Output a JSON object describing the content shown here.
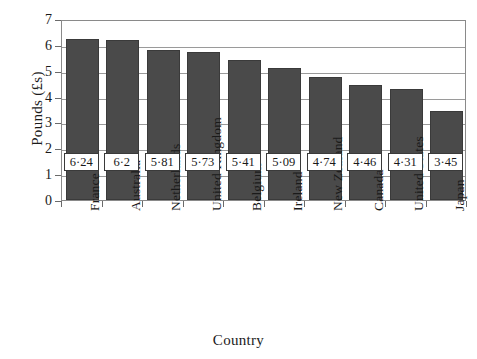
{
  "chart_data": {
    "type": "bar",
    "title": "",
    "xlabel": "Country",
    "ylabel": "Pounds (£s)",
    "categories": [
      "France",
      "Australia",
      "Netherlands",
      "United Kingdom",
      "Belgium",
      "Ireland",
      "New Zealand",
      "Canada",
      "United States",
      "Japan"
    ],
    "values": [
      6.24,
      6.2,
      5.81,
      5.73,
      5.41,
      5.09,
      4.74,
      4.46,
      4.31,
      3.45
    ],
    "value_labels": [
      "6·24",
      "6·2",
      "5·81",
      "5·73",
      "5·41",
      "5·09",
      "4·74",
      "4·46",
      "4·31",
      "3·45"
    ],
    "ylim": [
      0,
      7
    ],
    "yticks": [
      0,
      1,
      2,
      3,
      4,
      5,
      6,
      7
    ],
    "ytick_labels": [
      "0",
      "1",
      "2",
      "3",
      "4",
      "5",
      "6",
      "7"
    ],
    "grid": true,
    "legend": false,
    "bar_color": "#4a4a4a",
    "bar_edge_color": "#3a3a3a",
    "label_box_fill": "#ffffff",
    "label_box_border": "#3a3a3a",
    "grid_color": "#9a9a9a",
    "axis_color": "#8a8a8a",
    "background": "#ffffff"
  }
}
